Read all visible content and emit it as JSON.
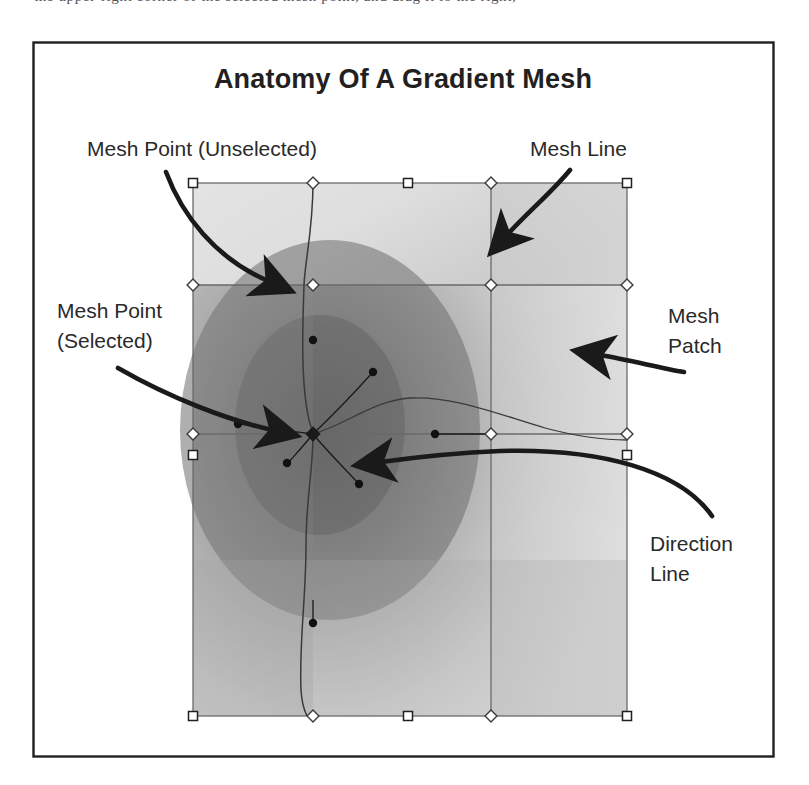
{
  "page": {
    "background": "#ffffff",
    "cropped_top_text": "the upper-right corner of the selected mesh point, and drag it to the right,",
    "frame": {
      "stroke": "#231f20",
      "x": 33,
      "y": 42,
      "width": 741,
      "height": 715
    }
  },
  "figure": {
    "title": "Anatomy Of A Gradient Mesh",
    "title_color": "#231f20"
  },
  "callouts": [
    {
      "id": "mesh-point-unselected",
      "lines": [
        "Mesh Point (Unselected)"
      ],
      "x": 87,
      "y": 156,
      "align": "left"
    },
    {
      "id": "mesh-line",
      "lines": [
        "Mesh Line"
      ],
      "x": 530,
      "y": 156,
      "align": "left"
    },
    {
      "id": "mesh-point-selected",
      "lines": [
        "Mesh Point",
        "(Selected)"
      ],
      "x": 57,
      "y": 318,
      "align": "left"
    },
    {
      "id": "mesh-patch",
      "lines": [
        "Mesh",
        "Patch"
      ],
      "x": 668,
      "y": 323,
      "align": "left"
    },
    {
      "id": "direction-line",
      "lines": [
        "Direction",
        "Line"
      ],
      "x": 650,
      "y": 551,
      "align": "left"
    }
  ],
  "mesh": {
    "bounds": {
      "left": 193,
      "top": 183,
      "right": 627,
      "bottom": 716
    },
    "columns_x": [
      193,
      313,
      408,
      491,
      627
    ],
    "rows_y": [
      183,
      285,
      434,
      455,
      716
    ],
    "grid_lines_v": [
      313,
      491
    ],
    "grid_lines_h": [
      285,
      434
    ],
    "stroke": "#6a6a6a",
    "handles": {
      "corner_square": {
        "size": 9,
        "fill": "#ffffff",
        "stroke": "#231f20"
      },
      "edge_diamond": {
        "size": 9,
        "fill": "#ffffff",
        "stroke": "#3c3c3c"
      },
      "direction_dot": {
        "radius": 4,
        "fill": "#111111"
      }
    },
    "selected_point": {
      "x": 313,
      "y": 434
    },
    "unselected_point": {
      "x": 313,
      "y": 285
    },
    "direction_handles": [
      {
        "x": 238,
        "y": 424
      },
      {
        "x": 373,
        "y": 372
      },
      {
        "x": 287,
        "y": 463
      },
      {
        "x": 359,
        "y": 484
      },
      {
        "x": 313,
        "y": 340
      },
      {
        "x": 313,
        "y": 623
      },
      {
        "x": 435,
        "y": 434
      }
    ],
    "gradient": {
      "highlight": "#e9e9e9",
      "midtone": "#c2c2c2",
      "shadow": "#7b7b7b",
      "dark_center": {
        "x": 330,
        "y": 430
      }
    }
  },
  "arrows": [
    {
      "id": "arrow-to-unselected-point",
      "from": {
        "x": 170,
        "y": 175
      },
      "to": {
        "x": 308,
        "y": 288
      }
    },
    {
      "id": "arrow-to-mesh-line",
      "from": {
        "x": 566,
        "y": 175
      },
      "to": {
        "x": 500,
        "y": 242
      }
    },
    {
      "id": "arrow-to-selected-point",
      "from": {
        "x": 120,
        "y": 370
      },
      "to": {
        "x": 307,
        "y": 435
      }
    },
    {
      "id": "arrow-to-mesh-patch",
      "from": {
        "x": 680,
        "y": 370
      },
      "to": {
        "x": 575,
        "y": 352
      }
    },
    {
      "id": "arrow-to-direction-line",
      "from": {
        "x": 700,
        "y": 520
      },
      "to": {
        "x": 360,
        "y": 460
      }
    }
  ]
}
